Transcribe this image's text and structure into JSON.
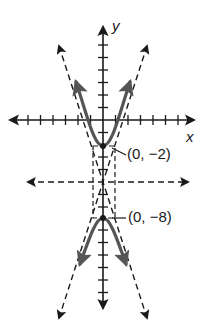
{
  "figure": {
    "type": "hyperbola-graph",
    "colors": {
      "ink": "#1a1a1a",
      "curve": "#555555",
      "background": "#ffffff"
    },
    "axes": {
      "x_label": "x",
      "y_label": "y"
    },
    "points": [
      {
        "label": "(0, −2)",
        "x": 0,
        "y": -2,
        "role": "vertex"
      },
      {
        "label": "(0, −8)",
        "x": 0,
        "y": -8,
        "role": "vertex"
      }
    ],
    "center": {
      "x": 0,
      "y": -5
    },
    "elements": [
      "x-axis",
      "y-axis",
      "hyperbola-upper-branch",
      "hyperbola-lower-branch",
      "asymptotes (dashed)",
      "central rectangle (dashed)",
      "horizontal line y = -5 (dashed)"
    ]
  }
}
